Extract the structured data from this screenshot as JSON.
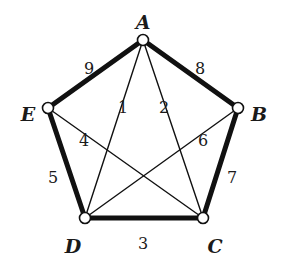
{
  "diagram": {
    "type": "weighted-graph",
    "nodes": [
      {
        "id": "A",
        "label": "A",
        "x": 143,
        "y": 40,
        "lx": 143,
        "ly": 22
      },
      {
        "id": "B",
        "label": "B",
        "x": 238,
        "y": 108,
        "lx": 259,
        "ly": 114
      },
      {
        "id": "C",
        "label": "C",
        "x": 203,
        "y": 218,
        "lx": 215,
        "ly": 246
      },
      {
        "id": "D",
        "label": "D",
        "x": 85,
        "y": 218,
        "lx": 73,
        "ly": 246
      },
      {
        "id": "E",
        "label": "E",
        "x": 48,
        "y": 108,
        "lx": 28,
        "ly": 114
      }
    ],
    "edges": [
      {
        "from": "A",
        "to": "B",
        "weight": "8",
        "bold": true,
        "lx": 200,
        "ly": 68
      },
      {
        "from": "B",
        "to": "C",
        "weight": "7",
        "bold": true,
        "lx": 232,
        "ly": 177
      },
      {
        "from": "C",
        "to": "D",
        "weight": "3",
        "bold": true,
        "lx": 143,
        "ly": 243
      },
      {
        "from": "D",
        "to": "E",
        "weight": "5",
        "bold": true,
        "lx": 53,
        "ly": 177
      },
      {
        "from": "E",
        "to": "A",
        "weight": "9",
        "bold": true,
        "lx": 89,
        "ly": 68
      },
      {
        "from": "A",
        "to": "D",
        "weight": "1",
        "bold": false,
        "lx": 123,
        "ly": 107
      },
      {
        "from": "A",
        "to": "C",
        "weight": "2",
        "bold": false,
        "lx": 164,
        "ly": 107
      },
      {
        "from": "E",
        "to": "C",
        "weight": "4",
        "bold": false,
        "lx": 84,
        "ly": 140
      },
      {
        "from": "B",
        "to": "D",
        "weight": "6",
        "bold": false,
        "lx": 203,
        "ly": 140
      }
    ]
  }
}
